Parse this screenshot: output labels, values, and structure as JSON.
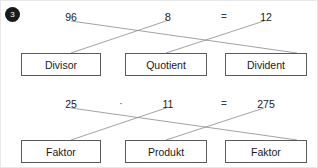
{
  "exercise": {
    "number": "3",
    "marker_icon": "numbered-bullet-icon"
  },
  "sections": [
    {
      "id": "division",
      "equation": {
        "terms": [
          "96",
          "8",
          "12"
        ],
        "operator": ":",
        "equals": "="
      },
      "boxes": [
        "Divisor",
        "Quotient",
        "Divident"
      ]
    },
    {
      "id": "multiplication",
      "equation": {
        "terms": [
          "25",
          "11",
          "275"
        ],
        "operator": "·",
        "equals": "="
      },
      "boxes": [
        "Faktor",
        "Produkt",
        "Faktor"
      ]
    }
  ],
  "style": {
    "line_color": "#8a8a8a",
    "box_border": "#5a5a5a",
    "text_color": "#1a1a1a"
  }
}
